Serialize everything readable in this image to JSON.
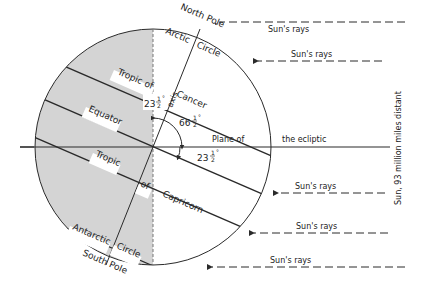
{
  "diagram": {
    "colors": {
      "line": "#2a2a2a",
      "shade": "#d4d4d4",
      "background": "#ffffff"
    },
    "labels": {
      "north_pole": "North Pole",
      "south_pole": "South Pole",
      "arctic": "Arctic",
      "arctic_circle": "Circle",
      "antarctic": "Antarctic",
      "antarctic_circle": "Circle",
      "tropic_of_top": "Tropic of",
      "cancer": "Cancer",
      "equator": "Equator",
      "tropic_bottom": "Tropic",
      "of_bottom": "of",
      "capricorn": "Capricorn",
      "axis": "axis",
      "plane_of": "Plane of",
      "the_ecliptic": "the ecliptic",
      "angle_axis_whole": "23",
      "angle_axis_frac_num": "1",
      "angle_axis_frac_den": "2",
      "angle_66_whole": "66",
      "angle_66_frac_num": "1",
      "angle_66_frac_den": "2",
      "angle_ecl_whole": "23",
      "angle_ecl_frac_num": "1",
      "angle_ecl_frac_den": "2",
      "degree": "°",
      "sun_distance": "Sun, 93 million miles distant"
    },
    "sun_rays": [
      {
        "label": "Sun's rays"
      },
      {
        "label": "Sun's rays"
      },
      {
        "label": "Sun's rays"
      },
      {
        "label": "Sun's rays"
      },
      {
        "label": "Sun's rays"
      }
    ]
  }
}
